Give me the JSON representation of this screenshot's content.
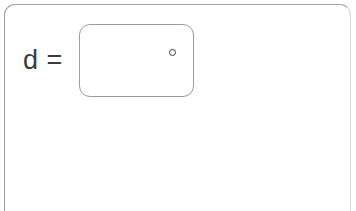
{
  "panel": {
    "background_color": "#ffffff",
    "border_color": "#9a9a9a",
    "border_color_light": "#d7d7d7",
    "corner_radius_px": 11,
    "bottom_edge": "open"
  },
  "equation": {
    "label": "d =",
    "label_color": "#3c3c3c",
    "label_font_size_px": 27
  },
  "value_box": {
    "value": "",
    "placeholder": "",
    "border_color": "#9c9c9c",
    "corner_radius_px": 11,
    "width_px": 115,
    "height_px": 73
  },
  "degree_marker": {
    "icon": "degree-circle-icon",
    "glyph": "°",
    "color": "#3a3a3a",
    "diameter_px": 7,
    "filled": false
  }
}
